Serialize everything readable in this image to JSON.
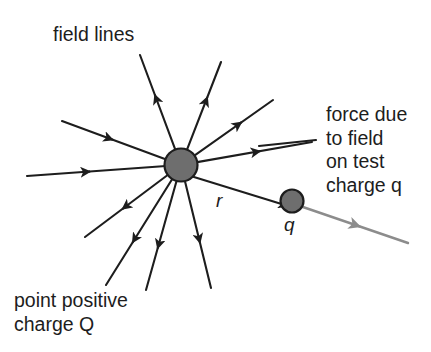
{
  "figure": {
    "kind": "physics-diagram",
    "title_visible": false,
    "background_color": "#ffffff",
    "line_color": "#1d1d1d",
    "charge_fill_color": "#6e6e6e",
    "charge_stroke_color": "#1d1d1d",
    "force_arrow_color": "#8c8c8c"
  },
  "labels": {
    "field_lines": "field lines",
    "force_line1": "force due",
    "force_line2": "to field",
    "force_line3": "on test",
    "force_line4_prefix": "charge ",
    "force_line4_symbol": "q",
    "point_charge_line1": "point positive",
    "point_charge_line2_prefix": "charge ",
    "point_charge_line2_symbol": "Q",
    "distance_symbol": "r",
    "test_charge_symbol": "q"
  },
  "geometry": {
    "source_charge": {
      "cx": 181,
      "cy": 165,
      "r": 16.5
    },
    "test_charge": {
      "cx": 292,
      "cy": 201,
      "r": 11.5
    },
    "field_lines": [
      {
        "name": "up-left-steep",
        "x1": 181,
        "y1": 165,
        "x2": 140,
        "y2": 55,
        "direction": "outward",
        "arrow_t": 0.58
      },
      {
        "name": "up-right-steep",
        "x1": 181,
        "y1": 165,
        "x2": 221,
        "y2": 62,
        "direction": "outward",
        "arrow_t": 0.6
      },
      {
        "name": "up-right-diagonal",
        "x1": 181,
        "y1": 165,
        "x2": 273,
        "y2": 100,
        "direction": "outward",
        "arrow_t": 0.6
      },
      {
        "name": "right-horizontal",
        "x1": 181,
        "y1": 165,
        "x2": 312,
        "y2": 142,
        "direction": "outward",
        "arrow_t": 0.55
      },
      {
        "name": "left-upper-diagonal",
        "x1": 181,
        "y1": 165,
        "x2": 62,
        "y2": 121,
        "direction": "inward",
        "arrow_t": 0.52
      },
      {
        "name": "left-horizontal",
        "x1": 181,
        "y1": 165,
        "x2": 27,
        "y2": 176,
        "direction": "inward",
        "arrow_t": 0.55
      },
      {
        "name": "down-left-diagonal",
        "x1": 181,
        "y1": 165,
        "x2": 85,
        "y2": 237,
        "direction": "outward",
        "arrow_t": 0.55
      },
      {
        "name": "down-left-steep",
        "x1": 181,
        "y1": 165,
        "x2": 106,
        "y2": 285,
        "direction": "outward",
        "arrow_t": 0.6
      },
      {
        "name": "down-center-left",
        "x1": 181,
        "y1": 165,
        "x2": 146,
        "y2": 290,
        "direction": "outward",
        "arrow_t": 0.62
      },
      {
        "name": "down-center-right",
        "x1": 181,
        "y1": 165,
        "x2": 211,
        "y2": 288,
        "direction": "outward",
        "arrow_t": 0.58
      }
    ],
    "distance_arrow": {
      "x1": 181,
      "y1": 173,
      "x2": 288,
      "y2": 206,
      "double_headed": true
    },
    "force_arrow": {
      "x1": 300,
      "y1": 206,
      "x2": 408,
      "y2": 243,
      "arrow_t": 0.55
    },
    "force_leader": {
      "x1": 259,
      "y1": 146,
      "x2": 316,
      "y2": 140
    },
    "field_lines_label_pos": {
      "x": 53,
      "y": 41
    },
    "force_label_pos": {
      "x": 326,
      "y": 121
    },
    "point_charge_label_pos": {
      "x": 14,
      "y": 307
    },
    "distance_label_pos": {
      "x": 216,
      "y": 207
    },
    "test_charge_label_pos": {
      "x": 284,
      "y": 231
    }
  }
}
